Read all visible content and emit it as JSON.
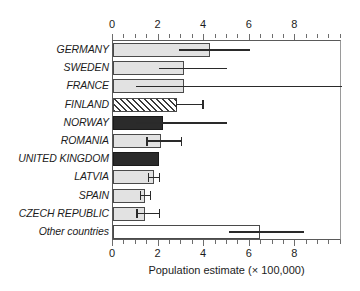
{
  "chart_data": {
    "type": "bar",
    "orientation": "horizontal",
    "title": "",
    "xlabel": "Population estimate (× 100,000)",
    "ylabel": "",
    "xlim": [
      0,
      10.05
    ],
    "xticks": [
      0,
      2,
      4,
      6,
      8
    ],
    "xtick_labels": [
      "0",
      "2",
      "4",
      "6",
      "8"
    ],
    "xtick_minor_step": 0.5,
    "grid": false,
    "legend": null,
    "axis_top": true,
    "axis_bottom": true,
    "categories": [
      "GERMANY",
      "SWEDEN",
      "FRANCE",
      "FINLAND",
      "NORWAY",
      "ROMANIA",
      "UNITED KINGDOM",
      "LATVIA",
      "SPAIN",
      "CZECH REPUBLIC",
      "Other countries"
    ],
    "values": [
      4.25,
      3.1,
      3.1,
      2.8,
      2.2,
      2.1,
      2.0,
      1.8,
      1.4,
      1.4,
      6.45
    ],
    "error_low": [
      2.9,
      2.0,
      1.0,
      2.8,
      1.0,
      1.5,
      null,
      1.55,
      1.2,
      1.05,
      5.1
    ],
    "error_high": [
      6.0,
      5.0,
      10.05,
      3.95,
      5.0,
      3.0,
      null,
      2.05,
      1.65,
      2.05,
      8.4
    ],
    "bar_styles": [
      "light-gray",
      "light-gray",
      "light-gray",
      "hatched",
      "dark",
      "light-gray",
      "dark",
      "light-gray",
      "light-gray",
      "light-gray",
      "white"
    ],
    "notes": [
      "FRANCE upper error whisker runs past the right plot border and is clipped by the figure edge.",
      "UNITED KINGDOM has no error bar drawn."
    ]
  },
  "colors": {
    "light_gray_fill": "#e2e2e2",
    "dark_fill": "#2b2b2b",
    "white_fill": "#ffffff",
    "bar_outline": "#4a4a4a",
    "error_bar": "#2a2a2a",
    "axis": "#5a5a5a",
    "text": "#1c1c1c",
    "background": "#ffffff"
  }
}
